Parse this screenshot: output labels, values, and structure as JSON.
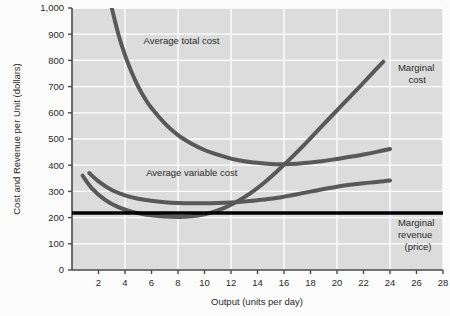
{
  "chart_data": {
    "type": "line",
    "title": "",
    "xlabel": "Output (units per day)",
    "ylabel": "Cost and Revenue per Unit (dollars)",
    "xlim": [
      0,
      28
    ],
    "ylim": [
      0,
      1000
    ],
    "xticks": [
      2,
      4,
      6,
      8,
      10,
      12,
      14,
      16,
      18,
      20,
      22,
      24,
      26,
      28
    ],
    "xtick_labels": [
      "2",
      "4",
      "6",
      "8",
      "10",
      "12",
      "14",
      "16",
      "18",
      "20",
      "22",
      "24",
      "26",
      "28"
    ],
    "yticks": [
      0,
      100,
      200,
      300,
      400,
      500,
      600,
      700,
      800,
      900,
      1000
    ],
    "ytick_labels": [
      "0",
      "100",
      "200",
      "300",
      "400",
      "500",
      "600",
      "700",
      "800",
      "900",
      "1,000"
    ],
    "grid": true,
    "grid_x_step": 4,
    "grid_y_step": 100,
    "plot_background": "#dcdcdc",
    "grid_color": "#ffffff",
    "legend_position": "inline-annotations",
    "series": [
      {
        "name": "Average total cost",
        "label_text": "Average total cost",
        "color": "#595959",
        "width": 4,
        "points": [
          [
            3.0,
            1000
          ],
          [
            3.5,
            900
          ],
          [
            4.0,
            820
          ],
          [
            4.5,
            755
          ],
          [
            5.0,
            700
          ],
          [
            5.5,
            655
          ],
          [
            6.0,
            618
          ],
          [
            7.0,
            560
          ],
          [
            8.0,
            515
          ],
          [
            9.0,
            483
          ],
          [
            10.0,
            458
          ],
          [
            11.0,
            440
          ],
          [
            12.0,
            425
          ],
          [
            13.0,
            415
          ],
          [
            14.0,
            409
          ],
          [
            15.0,
            405
          ],
          [
            16.0,
            404
          ],
          [
            17.0,
            406
          ],
          [
            18.0,
            410
          ],
          [
            19.0,
            416
          ],
          [
            20.0,
            424
          ],
          [
            21.0,
            432
          ],
          [
            22.0,
            441
          ],
          [
            23.0,
            451
          ],
          [
            24.0,
            462
          ]
        ]
      },
      {
        "name": "Average variable cost",
        "label_text": "Average variable cost",
        "color": "#595959",
        "width": 4,
        "points": [
          [
            1.3,
            370
          ],
          [
            2.0,
            338
          ],
          [
            3.0,
            305
          ],
          [
            4.0,
            285
          ],
          [
            5.0,
            272
          ],
          [
            6.0,
            264
          ],
          [
            7.0,
            259
          ],
          [
            8.0,
            256
          ],
          [
            9.0,
            255
          ],
          [
            10.0,
            255
          ],
          [
            11.0,
            256
          ],
          [
            12.0,
            258
          ],
          [
            13.0,
            261
          ],
          [
            14.0,
            266
          ],
          [
            15.0,
            272
          ],
          [
            16.0,
            280
          ],
          [
            17.0,
            289
          ],
          [
            18.0,
            299
          ],
          [
            19.0,
            309
          ],
          [
            20.0,
            318
          ],
          [
            21.0,
            325
          ],
          [
            22.0,
            331
          ],
          [
            23.0,
            336
          ],
          [
            24.0,
            342
          ]
        ]
      },
      {
        "name": "Marginal cost",
        "label_text": "Marginal cost",
        "color": "#595959",
        "width": 4,
        "points": [
          [
            0.8,
            360
          ],
          [
            1.5,
            312
          ],
          [
            2.5,
            268
          ],
          [
            3.5,
            240
          ],
          [
            4.5,
            223
          ],
          [
            5.5,
            212
          ],
          [
            6.5,
            206
          ],
          [
            7.5,
            203
          ],
          [
            8.5,
            203
          ],
          [
            9.5,
            208
          ],
          [
            10.5,
            219
          ],
          [
            11.5,
            237
          ],
          [
            12.5,
            262
          ],
          [
            13.5,
            294
          ],
          [
            14.5,
            333
          ],
          [
            15.5,
            378
          ],
          [
            16.5,
            426
          ],
          [
            17.5,
            477
          ],
          [
            18.5,
            530
          ],
          [
            19.5,
            583
          ],
          [
            20.5,
            636
          ],
          [
            21.5,
            688
          ],
          [
            22.5,
            742
          ],
          [
            23.5,
            795
          ]
        ]
      },
      {
        "name": "Marginal revenue (price)",
        "label_text": "Marginal revenue (price)",
        "color": "#000000",
        "width": 3.5,
        "points": [
          [
            0,
            218
          ],
          [
            28,
            218
          ]
        ]
      }
    ],
    "annotations": [
      {
        "text": "Average total cost",
        "x": 5.4,
        "y": 862
      },
      {
        "text": "Average variable cost",
        "x": 5.6,
        "y": 360
      },
      {
        "text": "Marginal",
        "x": 24.6,
        "y": 760
      },
      {
        "text": "cost",
        "x": 25.4,
        "y": 712
      },
      {
        "text": "Marginal",
        "x": 24.6,
        "y": 168
      },
      {
        "text": "revenue",
        "x": 24.6,
        "y": 123
      },
      {
        "text": "(price)",
        "x": 25.1,
        "y": 78
      }
    ]
  },
  "axes": {
    "ylabel": "Cost and Revenue per Unit (dollars)",
    "xlabel": "Output (units per day)"
  },
  "ytick_labels": [
    "1,000",
    "900",
    "800",
    "700",
    "600",
    "500",
    "400",
    "300",
    "200",
    "100",
    "0"
  ],
  "xtick_labels": [
    "2",
    "4",
    "6",
    "8",
    "10",
    "12",
    "14",
    "16",
    "18",
    "20",
    "22",
    "24",
    "26",
    "28"
  ],
  "annotation_labels": {
    "atc": "Average total cost",
    "avc": "Average variable cost",
    "mc_line1": "Marginal",
    "mc_line2": "cost",
    "mr_line1": "Marginal",
    "mr_line2": "revenue",
    "mr_line3": "(price)"
  }
}
